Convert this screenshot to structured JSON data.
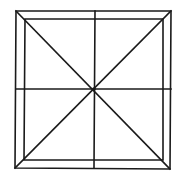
{
  "diagram": {
    "title": "",
    "type": "geometric-figure",
    "stroke_color": "#1a1a1a",
    "background": "#ffffff",
    "outer_square": {
      "tl": [
        16,
        11
      ],
      "tr": [
        171,
        11
      ],
      "br": [
        170,
        169
      ],
      "bl": [
        15,
        168
      ]
    },
    "inner_square": {
      "tl": [
        25,
        19
      ],
      "tr": [
        163,
        19
      ],
      "br": [
        163,
        160
      ],
      "bl": [
        24,
        160
      ]
    },
    "center": [
      94,
      89
    ],
    "midlines": {
      "vertical": {
        "x1": 95,
        "y1": 11,
        "x2": 94,
        "y2": 168
      },
      "horizontal": {
        "x1": 16,
        "y1": 89,
        "x2": 171,
        "y2": 89
      }
    },
    "diagonals": [
      {
        "from": [
          16,
          11
        ],
        "to": [
          170,
          169
        ]
      },
      {
        "from": [
          171,
          11
        ],
        "to": [
          15,
          168
        ]
      }
    ]
  }
}
